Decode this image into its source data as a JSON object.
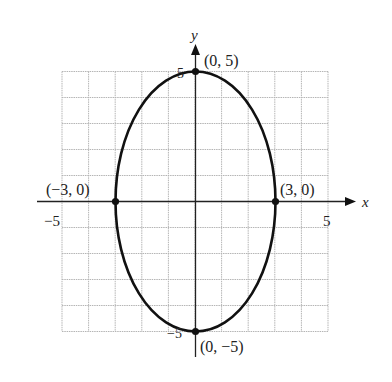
{
  "chart_data": {
    "type": "line",
    "title": "",
    "xlabel": "x",
    "ylabel": "y",
    "xlim": [
      -5,
      5
    ],
    "ylim": [
      -5,
      5
    ],
    "grid": true,
    "grid_step": 1,
    "x_ticks": [
      {
        "value": -5,
        "label": "−5"
      },
      {
        "value": 5,
        "label": "5"
      }
    ],
    "y_ticks": [
      {
        "value": 5,
        "label": "5"
      },
      {
        "value": -5,
        "label": "−5"
      }
    ],
    "series": [
      {
        "name": "ellipse",
        "shape": "ellipse",
        "center": [
          0,
          0
        ],
        "semi_axis_x": 3,
        "semi_axis_y": 5,
        "color": "#111111"
      }
    ],
    "points": [
      {
        "x": 0,
        "y": 5,
        "label": "(0, 5)"
      },
      {
        "x": 3,
        "y": 0,
        "label": "(3, 0)"
      },
      {
        "x": 0,
        "y": -5,
        "label": "(0, −5)"
      },
      {
        "x": -3,
        "y": 0,
        "label": "(−3, 0)"
      }
    ]
  },
  "axes": {
    "x_label": "x",
    "y_label": "y",
    "x_tick_neg": "−5",
    "x_tick_pos": "5",
    "y_tick_pos": "5",
    "y_tick_neg": "−5"
  },
  "point_labels": {
    "top": "(0, 5)",
    "right": "(3, 0)",
    "bottom": "(0, −5)",
    "left": "(−3, 0)"
  },
  "colors": {
    "grid": "#b5b5b5",
    "axis": "#222222",
    "curve": "#111111"
  }
}
